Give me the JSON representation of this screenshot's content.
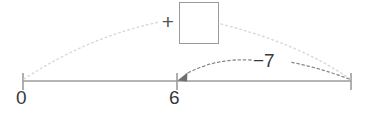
{
  "figure": {
    "type": "number-line-diagram",
    "background_color": "#ffffff",
    "axis_color": "#9b9b9b",
    "text_color": "#3a3a3a",
    "faint_arc_color": "#d8d8d8",
    "dark_arc_color": "#8a8a8a",
    "box_border_color": "#9a9a9a"
  },
  "number_line": {
    "ticks": [
      {
        "label": "0",
        "x": 23
      },
      {
        "label": "6",
        "x": 177
      },
      {
        "label": "",
        "x": 351
      }
    ],
    "line_y": 81,
    "start_x": 23,
    "end_x": 351
  },
  "operation": {
    "plus_sign": "+",
    "missing_value_box": "",
    "jump_label": "−7"
  },
  "arcs": [
    {
      "name": "total-jump-arc",
      "from_label": "0",
      "to_label": "end",
      "style": "dotted",
      "direction": "right",
      "has_arrowhead": false
    },
    {
      "name": "minus-seven-arc",
      "from_label": "end",
      "to_label": "6",
      "style": "dashed",
      "direction": "left",
      "has_arrowhead": true,
      "value": "−7"
    }
  ]
}
